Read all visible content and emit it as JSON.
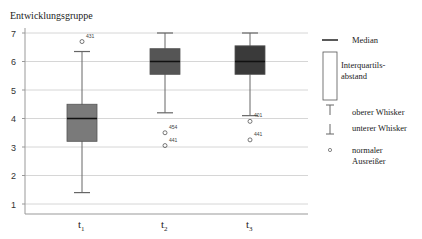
{
  "chart_data": {
    "type": "box",
    "title": "Entwicklungsgruppe",
    "xlabel": "",
    "ylabel": "",
    "ylim": [
      0.7,
      7.1
    ],
    "yticks": [
      1,
      2,
      3,
      4,
      5,
      6,
      7
    ],
    "grid": true,
    "legend_position": "right",
    "categories": [
      "t1",
      "t2",
      "t3"
    ],
    "category_labels": [
      {
        "base": "t",
        "sub": "1"
      },
      {
        "base": "t",
        "sub": "2"
      },
      {
        "base": "t",
        "sub": "3"
      }
    ],
    "boxes": [
      {
        "category": "t1",
        "whisker_low": 1.4,
        "q1": 3.2,
        "median": 4.0,
        "q3": 4.5,
        "whisker_high": 6.35,
        "color": "#7a7a7a",
        "outliers": [
          {
            "value": 6.7,
            "label": "431"
          }
        ]
      },
      {
        "category": "t2",
        "whisker_low": 4.2,
        "q1": 5.55,
        "median": 6.0,
        "q3": 6.45,
        "whisker_high": 7.0,
        "color": "#555555",
        "outliers": [
          {
            "value": 3.5,
            "label": "454"
          },
          {
            "value": 3.05,
            "label": "441"
          }
        ]
      },
      {
        "category": "t3",
        "whisker_low": 4.1,
        "q1": 5.55,
        "median": 6.0,
        "q3": 6.55,
        "whisker_high": 7.0,
        "color": "#3a3a3a",
        "outliers": [
          {
            "value": 3.9,
            "label": "401"
          },
          {
            "value": 3.25,
            "label": "441"
          }
        ]
      }
    ],
    "legend": [
      {
        "symbol": "median-line",
        "label": "Median"
      },
      {
        "symbol": "box",
        "label": "Interquartils-\nabstand",
        "lines": [
          "Interquartils-",
          "abstand"
        ]
      },
      {
        "symbol": "upper-whisker",
        "label": "oberer Whisker"
      },
      {
        "symbol": "lower-whisker",
        "label": "unterer Whisker"
      },
      {
        "symbol": "outlier-circle",
        "label": "normaler\nAusreißer",
        "lines": [
          "normaler",
          "Ausreißer"
        ]
      }
    ]
  }
}
